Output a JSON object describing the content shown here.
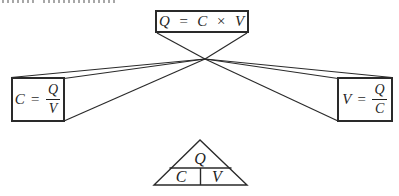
{
  "page": {
    "background": "#ffffff",
    "ink_color": "#2a2a2a"
  },
  "diagram": {
    "top_box": {
      "formula": "Q = C × V"
    },
    "left_box": {
      "lhs": "C",
      "eq": "=",
      "num": "Q",
      "den": "V"
    },
    "right_box": {
      "lhs": "V",
      "eq": "=",
      "num": "Q",
      "den": "C"
    },
    "triangle": {
      "top": "Q",
      "bottom_left": "C",
      "bottom_right": "V"
    }
  }
}
